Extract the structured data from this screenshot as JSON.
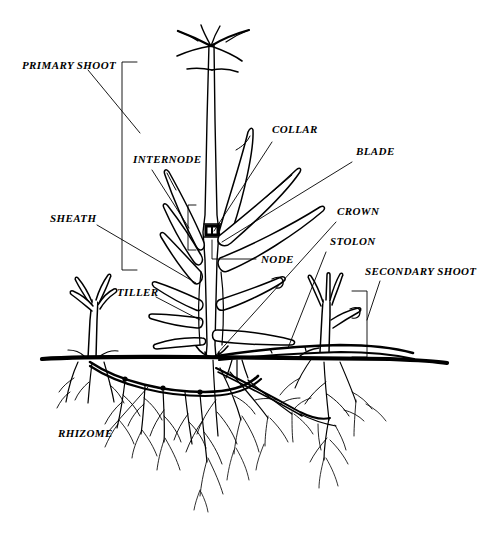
{
  "figure": {
    "line_color": "#000000",
    "background_color": "#ffffff",
    "width": 489,
    "height": 534
  },
  "labels": {
    "primary_shoot": "PRIMARY SHOOT",
    "internode": "INTERNODE",
    "collar": "COLLAR",
    "blade": "BLADE",
    "sheath": "SHEATH",
    "crown": "CROWN",
    "stolon": "STOLON",
    "node": "NODE",
    "tiller": "TILLER",
    "secondary_shoot": "SECONDARY SHOOT",
    "rhizome": "RHIZOME"
  },
  "parts": [
    {
      "key": "primary_shoot",
      "label": "PRIMARY SHOOT",
      "marker": "bracket",
      "side": "left"
    },
    {
      "key": "internode",
      "label": "INTERNODE",
      "marker": "bracket",
      "side": "left"
    },
    {
      "key": "sheath",
      "label": "SHEATH",
      "marker": "leader",
      "side": "left"
    },
    {
      "key": "tiller",
      "label": "TILLER",
      "marker": "leader",
      "side": "left"
    },
    {
      "key": "rhizome",
      "label": "RHIZOME",
      "marker": "leader",
      "side": "left"
    },
    {
      "key": "collar",
      "label": "COLLAR",
      "marker": "leader",
      "side": "right"
    },
    {
      "key": "blade",
      "label": "BLADE",
      "marker": "leader",
      "side": "right"
    },
    {
      "key": "crown",
      "label": "CROWN",
      "marker": "leader",
      "side": "right"
    },
    {
      "key": "stolon",
      "label": "STOLON",
      "marker": "leader",
      "side": "right"
    },
    {
      "key": "node",
      "label": "NODE",
      "marker": "leader",
      "side": "right"
    },
    {
      "key": "secondary_shoot",
      "label": "SECONDARY SHOOT",
      "marker": "bracket",
      "side": "right"
    }
  ]
}
